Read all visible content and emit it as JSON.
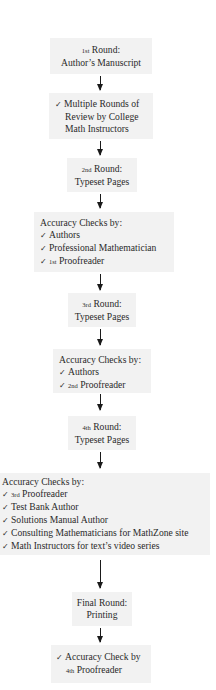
{
  "flowchart": {
    "colors": {
      "box_bg": "#f2f2f2",
      "arrow": "#1a1a1a",
      "text": "#2a2a2a"
    },
    "steps": [
      {
        "id": "round1",
        "lines": [
          {
            "ord": "1st",
            "text": "Round:"
          },
          {
            "text": "Author’s Manuscript"
          }
        ]
      },
      {
        "id": "review",
        "check": "✓",
        "lines": [
          {
            "text": "Multiple Rounds of"
          },
          {
            "text": "Review by College"
          },
          {
            "text": "Math Instructors"
          }
        ]
      },
      {
        "id": "round2",
        "lines": [
          {
            "ord": "2nd",
            "text": "Round:"
          },
          {
            "text": "Typeset Pages"
          }
        ]
      },
      {
        "id": "checks1",
        "heading": "Accuracy Checks by:",
        "items": [
          {
            "text": "Authors"
          },
          {
            "text": "Professional Mathematician"
          },
          {
            "ord": "1st",
            "text": "Proofreader"
          }
        ]
      },
      {
        "id": "round3",
        "lines": [
          {
            "ord": "3rd",
            "text": "Round:"
          },
          {
            "text": "Typeset Pages"
          }
        ]
      },
      {
        "id": "checks2",
        "heading": "Accuracy Checks by:",
        "items": [
          {
            "text": "Authors"
          },
          {
            "ord": "2nd",
            "text": "Proofreader"
          }
        ]
      },
      {
        "id": "round4",
        "lines": [
          {
            "ord": "4th",
            "text": "Round:"
          },
          {
            "text": "Typeset Pages"
          }
        ]
      },
      {
        "id": "checks3",
        "heading": "Accuracy Checks by:",
        "items": [
          {
            "ord": "3rd",
            "text": "Proofreader"
          },
          {
            "text": "Test Bank Author"
          },
          {
            "text": "Solutions Manual Author"
          },
          {
            "text": "Consulting Mathematicians for MathZone site"
          },
          {
            "text": "Math Instructors for text’s video series"
          }
        ]
      },
      {
        "id": "final",
        "lines": [
          {
            "text": "Final Round:"
          },
          {
            "text": "Printing"
          }
        ]
      },
      {
        "id": "final_check",
        "check": "✓",
        "lines": [
          {
            "text": "Accuracy Check by"
          },
          {
            "ord": "4th",
            "text": "Proofreader"
          }
        ]
      }
    ],
    "check_glyph": "✓"
  }
}
